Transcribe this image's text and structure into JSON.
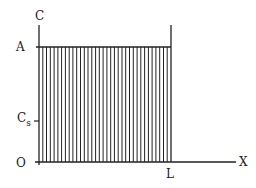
{
  "diagram": {
    "axes": {
      "y_label": "C",
      "x_label": "X",
      "origin_label": "O"
    },
    "labels": {
      "top_level": "A",
      "saturation_main": "C",
      "saturation_sub": "s",
      "length": "L"
    },
    "region": {
      "fill": "vertical-hatching",
      "line_count": 35,
      "x_start": 39,
      "x_end": 171,
      "y_top": 47,
      "y_bottom": 162
    },
    "colors": {
      "stroke": "#222222",
      "background": "#ffffff"
    }
  }
}
